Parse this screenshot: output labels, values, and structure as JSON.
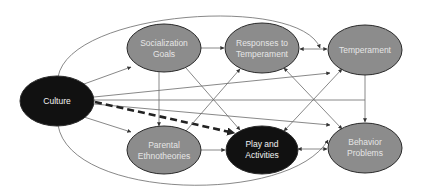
{
  "diagram": {
    "type": "path-model",
    "colors": {
      "background": "#ffffff",
      "node_gray": "#8c8c8c",
      "node_black": "#111111",
      "node_stroke": "#2a2a2a",
      "edge": "#6a6a6a",
      "dashed_edge": "#222222",
      "label_text": "#e6e6e6"
    },
    "nodes": {
      "culture": {
        "label": [
          "Culture"
        ],
        "fill": "black"
      },
      "socialization_goals": {
        "label": [
          "Socialization",
          "Goals"
        ],
        "fill": "gray"
      },
      "responses_to_temperament": {
        "label": [
          "Responses to",
          "Temperament"
        ],
        "fill": "gray"
      },
      "temperament": {
        "label": [
          "Temperament"
        ],
        "fill": "gray"
      },
      "parental_ethnotheories": {
        "label": [
          "Parental",
          "Ethnotheories"
        ],
        "fill": "gray"
      },
      "play_and_activities": {
        "label": [
          "Play and",
          "Activities"
        ],
        "fill": "black"
      },
      "behavior_problems": {
        "label": [
          "Behavior",
          "Problems"
        ],
        "fill": "gray"
      }
    },
    "edges": [
      {
        "from": "Culture",
        "to": "Socialization Goals",
        "style": "solid"
      },
      {
        "from": "Culture",
        "to": "Parental Ethnotheories",
        "style": "solid"
      },
      {
        "from": "Culture",
        "to": "Play and Activities",
        "style": "dashed-bold"
      },
      {
        "from": "Culture",
        "to": "Temperament",
        "style": "solid"
      },
      {
        "from": "Culture",
        "to": "Behavior Problems",
        "style": "solid"
      },
      {
        "from": "Culture",
        "to": "Temperament (outer arc)",
        "style": "solid"
      },
      {
        "from": "Culture",
        "to": "Behavior Problems (outer arc)",
        "style": "solid"
      },
      {
        "from": "Socialization Goals",
        "to": "Responses to Temperament",
        "style": "solid"
      },
      {
        "from": "Socialization Goals",
        "to": "Parental Ethnotheories",
        "style": "solid"
      },
      {
        "from": "Socialization Goals",
        "to": "Play and Activities",
        "style": "solid"
      },
      {
        "from": "Parental Ethnotheories",
        "to": "Play and Activities",
        "style": "solid"
      },
      {
        "from": "Parental Ethnotheories",
        "to": "Responses to Temperament",
        "style": "solid"
      },
      {
        "from": "Responses to Temperament",
        "to": "Temperament",
        "style": "bidirectional"
      },
      {
        "from": "Responses to Temperament",
        "to": "Behavior Problems",
        "style": "solid"
      },
      {
        "from": "Play and Activities",
        "to": "Temperament",
        "style": "solid"
      },
      {
        "from": "Play and Activities",
        "to": "Behavior Problems",
        "style": "bidirectional"
      },
      {
        "from": "Temperament",
        "to": "Behavior Problems",
        "style": "solid"
      }
    ]
  }
}
